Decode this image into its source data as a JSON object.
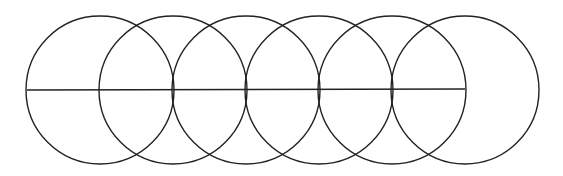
{
  "diagram": {
    "width": 563,
    "height": 176,
    "stroke_color": "#222222",
    "background": "#ffffff",
    "circles": [
      {
        "cx": 100,
        "cy": 90,
        "r": 74
      },
      {
        "cx": 173,
        "cy": 90,
        "r": 74
      },
      {
        "cx": 246,
        "cy": 90,
        "r": 74
      },
      {
        "cx": 319,
        "cy": 90,
        "r": 74
      },
      {
        "cx": 392,
        "cy": 90,
        "r": 74
      },
      {
        "cx": 465,
        "cy": 90,
        "r": 74
      }
    ],
    "line": {
      "x1": 27,
      "y1": 90,
      "x2": 465,
      "y2": 89
    }
  }
}
